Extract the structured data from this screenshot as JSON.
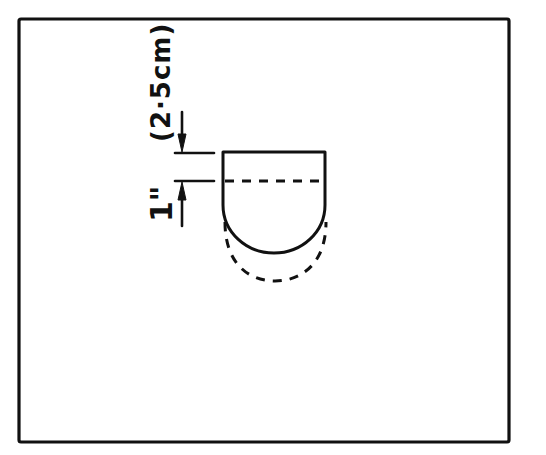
{
  "diagram": {
    "type": "technical-sketch",
    "frame": {
      "x": 19,
      "y": 19,
      "width": 490,
      "height": 423
    },
    "shape": {
      "top_edge_y": 152,
      "fold_line_y": 181,
      "left_x": 223,
      "right_x": 325,
      "solid_bottom_y": 253,
      "dashed_bottom_y": 281,
      "fold_line_style": "dashed",
      "extension_style": "dashed"
    },
    "dimension": {
      "imperial_label": "1\"",
      "metric_label": "(2·5cm)",
      "measures": "distance between top edge and dashed fold line",
      "arrow_style": "outside arrows pointing inward"
    },
    "colors": {
      "ink": "#111111",
      "paper": "#ffffff"
    }
  }
}
